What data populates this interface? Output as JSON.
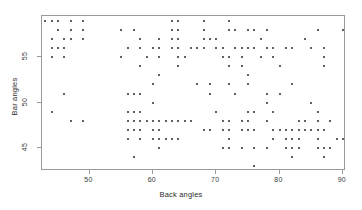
{
  "chart_data": {
    "type": "scatter",
    "title": "",
    "xlabel": "Back angles",
    "ylabel": "Bar angles",
    "xlim": [
      42.5,
      90.5
    ],
    "ylim": [
      42.5,
      59.5
    ],
    "xticks": [
      50,
      60,
      70,
      80,
      90
    ],
    "yticks": [
      45,
      50,
      55
    ],
    "grid": false,
    "legend": null,
    "marker": "point",
    "marker_color": "#2b2b2b",
    "frame_color": "#9a9a9a",
    "points": [
      [
        43,
        59
      ],
      [
        44,
        59
      ],
      [
        45,
        59
      ],
      [
        47,
        59
      ],
      [
        49,
        59
      ],
      [
        63,
        59
      ],
      [
        64,
        59
      ],
      [
        68,
        59
      ],
      [
        72,
        59
      ],
      [
        45,
        58
      ],
      [
        47,
        58
      ],
      [
        49,
        58
      ],
      [
        55,
        58
      ],
      [
        57,
        58
      ],
      [
        63,
        58
      ],
      [
        64,
        58
      ],
      [
        68,
        58
      ],
      [
        72,
        58
      ],
      [
        73,
        58
      ],
      [
        75,
        58
      ],
      [
        76,
        58
      ],
      [
        78,
        58
      ],
      [
        86,
        58
      ],
      [
        90,
        58
      ],
      [
        44,
        57
      ],
      [
        46,
        57
      ],
      [
        47,
        57
      ],
      [
        49,
        57
      ],
      [
        58,
        57
      ],
      [
        61,
        57
      ],
      [
        63,
        57
      ],
      [
        64,
        57
      ],
      [
        68,
        57
      ],
      [
        69,
        57
      ],
      [
        70,
        57
      ],
      [
        77,
        57
      ],
      [
        84,
        57
      ],
      [
        44,
        56
      ],
      [
        45,
        56
      ],
      [
        46,
        56
      ],
      [
        56,
        56
      ],
      [
        58,
        56
      ],
      [
        60,
        56
      ],
      [
        61,
        56
      ],
      [
        63,
        56
      ],
      [
        64,
        56
      ],
      [
        66,
        56
      ],
      [
        67,
        56
      ],
      [
        68,
        56
      ],
      [
        70,
        56
      ],
      [
        71,
        56
      ],
      [
        73,
        56
      ],
      [
        74,
        56
      ],
      [
        75,
        56
      ],
      [
        76,
        56
      ],
      [
        78,
        56
      ],
      [
        79,
        56
      ],
      [
        81,
        56
      ],
      [
        82,
        56
      ],
      [
        85,
        56
      ],
      [
        87,
        56
      ],
      [
        44,
        55
      ],
      [
        46,
        55
      ],
      [
        55,
        55
      ],
      [
        59,
        55
      ],
      [
        61,
        55
      ],
      [
        64,
        55
      ],
      [
        65,
        55
      ],
      [
        71,
        55
      ],
      [
        72,
        55
      ],
      [
        74,
        55
      ],
      [
        77,
        55
      ],
      [
        79,
        55
      ],
      [
        87,
        55
      ],
      [
        58,
        54
      ],
      [
        64,
        54
      ],
      [
        72,
        54
      ],
      [
        74,
        54
      ],
      [
        80,
        54
      ],
      [
        87,
        54
      ],
      [
        61,
        53
      ],
      [
        75,
        53
      ],
      [
        60,
        52
      ],
      [
        67,
        52
      ],
      [
        69,
        52
      ],
      [
        72,
        52
      ],
      [
        75,
        52
      ],
      [
        82,
        52
      ],
      [
        46,
        51
      ],
      [
        56,
        51
      ],
      [
        57,
        51
      ],
      [
        58,
        51
      ],
      [
        69,
        51
      ],
      [
        73,
        51
      ],
      [
        78,
        51
      ],
      [
        80,
        51
      ],
      [
        60,
        50
      ],
      [
        78,
        50
      ],
      [
        85,
        50
      ],
      [
        44,
        49
      ],
      [
        56,
        49
      ],
      [
        57,
        49
      ],
      [
        58,
        49
      ],
      [
        70,
        49
      ],
      [
        75,
        49
      ],
      [
        76,
        49
      ],
      [
        79,
        49
      ],
      [
        86,
        49
      ],
      [
        47,
        48
      ],
      [
        49,
        48
      ],
      [
        56,
        48
      ],
      [
        57,
        48
      ],
      [
        58,
        48
      ],
      [
        59,
        48
      ],
      [
        60,
        48
      ],
      [
        61,
        48
      ],
      [
        62,
        48
      ],
      [
        63,
        48
      ],
      [
        64,
        48
      ],
      [
        65,
        48
      ],
      [
        66,
        48
      ],
      [
        71,
        48
      ],
      [
        72,
        48
      ],
      [
        74,
        48
      ],
      [
        75,
        48
      ],
      [
        78,
        48
      ],
      [
        83,
        48
      ],
      [
        84,
        48
      ],
      [
        86,
        48
      ],
      [
        88,
        48
      ],
      [
        56,
        47
      ],
      [
        57,
        47
      ],
      [
        58,
        47
      ],
      [
        60,
        47
      ],
      [
        61,
        47
      ],
      [
        68,
        47
      ],
      [
        69,
        47
      ],
      [
        71,
        47
      ],
      [
        72,
        47
      ],
      [
        74,
        47
      ],
      [
        75,
        47
      ],
      [
        76,
        47
      ],
      [
        79,
        47
      ],
      [
        80,
        47
      ],
      [
        81,
        47
      ],
      [
        82,
        47
      ],
      [
        83,
        47
      ],
      [
        84,
        47
      ],
      [
        85,
        47
      ],
      [
        86,
        47
      ],
      [
        87,
        47
      ],
      [
        56,
        46
      ],
      [
        58,
        46
      ],
      [
        60,
        46
      ],
      [
        61,
        46
      ],
      [
        62,
        46
      ],
      [
        63,
        46
      ],
      [
        64,
        46
      ],
      [
        72,
        46
      ],
      [
        79,
        46
      ],
      [
        81,
        46
      ],
      [
        82,
        46
      ],
      [
        83,
        46
      ],
      [
        86,
        46
      ],
      [
        89,
        46
      ],
      [
        90,
        46
      ],
      [
        61,
        45
      ],
      [
        71,
        45
      ],
      [
        72,
        45
      ],
      [
        74,
        45
      ],
      [
        76,
        45
      ],
      [
        78,
        45
      ],
      [
        81,
        45
      ],
      [
        82,
        45
      ],
      [
        83,
        45
      ],
      [
        86,
        45
      ],
      [
        87,
        45
      ],
      [
        88,
        45
      ],
      [
        57,
        44
      ],
      [
        82,
        44
      ],
      [
        87,
        44
      ],
      [
        76,
        43
      ]
    ]
  }
}
